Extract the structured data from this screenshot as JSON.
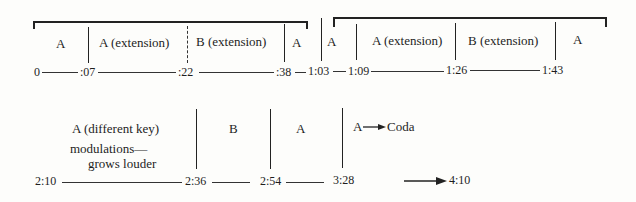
{
  "diagram": {
    "type": "musical-form-timeline",
    "row1": {
      "sections": [
        {
          "label": "A",
          "start": "0",
          "end": ":07"
        },
        {
          "label": "A (extension)",
          "start": ":07",
          "end": ":22"
        },
        {
          "label": "B (extension)",
          "start": ":22",
          "end": ":38"
        },
        {
          "label": "A",
          "start": ":38",
          "end": "1:03"
        },
        {
          "label": "A",
          "start": "1:03",
          "end": "1:09"
        },
        {
          "label": "A (extension)",
          "start": "1:09",
          "end": "1:26"
        },
        {
          "label": "B (extension)",
          "start": "1:26",
          "end": "1:43"
        },
        {
          "label": "A",
          "start": "1:43",
          "end": ""
        }
      ],
      "times": [
        "0",
        ":07",
        ":22",
        ":38",
        "1:03",
        "1:09",
        "1:26",
        "1:43"
      ]
    },
    "row2": {
      "sections": [
        {
          "label": "A (different key)",
          "note_line1": "modulations—",
          "note_line2": "grows louder",
          "start": "2:10",
          "end": "2:36"
        },
        {
          "label": "B",
          "start": "2:36",
          "end": "2:54"
        },
        {
          "label": "A",
          "start": "2:54",
          "end": "3:28"
        },
        {
          "label": "A",
          "arrow_to": "Coda",
          "start": "3:28",
          "end": "4:10"
        }
      ],
      "times": [
        "2:10",
        "2:36",
        "2:54",
        "3:28",
        "4:10"
      ]
    },
    "colors": {
      "ink": "#1e1e1e",
      "paper": "#fdfdfb"
    }
  }
}
